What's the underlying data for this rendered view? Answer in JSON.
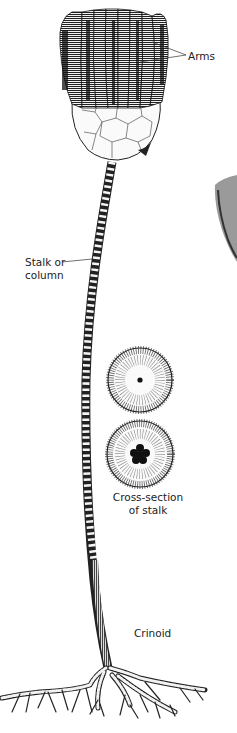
{
  "figure": {
    "subject": "Crinoid",
    "labels": {
      "arms": "Arms",
      "stalk_line1": "Stalk or",
      "stalk_line2": "column",
      "cross_section_line1": "Cross-section",
      "cross_section_line2": "of stalk",
      "crinoid": "Crinoid"
    },
    "colors": {
      "background": "#ffffff",
      "ink": "#1a1a1a",
      "shade": "#555555",
      "neighbor_specimen": "#8a8a8a"
    }
  }
}
